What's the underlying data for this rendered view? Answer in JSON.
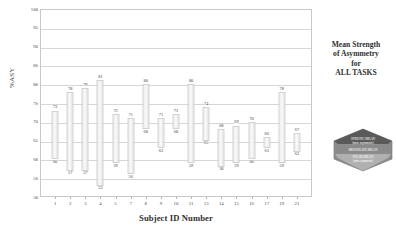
{
  "chart_data": {
    "type": "bar",
    "subtype": "floating-range-bar",
    "title": "",
    "xlabel": "Subject ID Number",
    "ylabel": "%ASY",
    "ylim": [
      50,
      100
    ],
    "ytick_step": 5,
    "yticks": [
      50,
      55,
      60,
      65,
      70,
      75,
      80,
      85,
      90,
      95,
      100
    ],
    "grid": true,
    "legend_position": "right",
    "categories": [
      "1",
      "2",
      "3",
      "4",
      "5",
      "7",
      "8",
      "9",
      "10",
      "11",
      "13",
      "14",
      "15",
      "16",
      "17",
      "19",
      "21"
    ],
    "series": [
      {
        "name": "range-low",
        "values": [
          60,
          57,
          57,
          53,
          59,
          56,
          68,
          63,
          68,
          59,
          65,
          58,
          59,
          60,
          63,
          59,
          62
        ]
      },
      {
        "name": "range-high",
        "values": [
          73,
          78,
          79,
          81,
          72,
          71,
          80,
          71,
          72,
          80,
          74,
          68,
          69,
          70,
          66,
          78,
          67
        ]
      }
    ],
    "bars": [
      {
        "category": "1",
        "low": 60,
        "high": 73
      },
      {
        "category": "2",
        "low": 57,
        "high": 78
      },
      {
        "category": "3",
        "low": 57,
        "high": 79
      },
      {
        "category": "4",
        "low": 53,
        "high": 81
      },
      {
        "category": "5",
        "low": 59,
        "high": 72
      },
      {
        "category": "7",
        "low": 56,
        "high": 71
      },
      {
        "category": "8",
        "low": 68,
        "high": 80
      },
      {
        "category": "9",
        "low": 63,
        "high": 71
      },
      {
        "category": "10",
        "low": 68,
        "high": 72
      },
      {
        "category": "11",
        "low": 59,
        "high": 80
      },
      {
        "category": "13",
        "low": 65,
        "high": 74
      },
      {
        "category": "14",
        "low": 58,
        "high": 68
      },
      {
        "category": "15",
        "low": 59,
        "high": 69
      },
      {
        "category": "16",
        "low": 60,
        "high": 70
      },
      {
        "category": "17",
        "low": 63,
        "high": 66
      },
      {
        "category": "19",
        "low": 59,
        "high": 78
      },
      {
        "category": "21",
        "low": 62,
        "high": 67
      }
    ]
  },
  "legend": {
    "line1": "Mean Strength",
    "line2": "of Asymmetry",
    "line3": "for",
    "line4": "ALL TASKS"
  },
  "emblem": {
    "line1": "STRONG MEAN",
    "line2": "(more asymmetric)",
    "line3": "MODERATE MEAN",
    "line4": "WEAK MEAN",
    "line5": "(more symmetric)"
  },
  "colors": {
    "bar_fill": "#efefef",
    "bar_edge": "#d2d2d2",
    "grid": "#d6d6d6",
    "frame": "#c9c9c9",
    "text": "#3a3a3a",
    "emblem_dark": "#4a4a4a",
    "emblem_mid": "#7a7a7a",
    "emblem_light": "#a8a8a8"
  }
}
